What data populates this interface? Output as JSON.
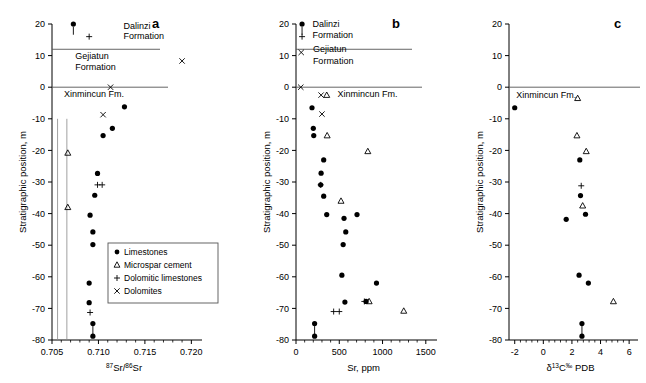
{
  "figure": {
    "panels": [
      "a",
      "b",
      "c"
    ],
    "shared_ylabel": "Stratigraphic position, m",
    "y_ticks": [
      "20",
      "10",
      "0",
      "-10",
      "-20",
      "-30",
      "-40",
      "-50",
      "-60",
      "-70",
      "-80"
    ],
    "formations": {
      "dalinzi": "Dalinzi",
      "dalinzi_second": "Formation",
      "gejiatun": "Gejiatun",
      "gejiatun_second": "Formation",
      "xinmincun": "Xinmincun Fm."
    },
    "legend": {
      "items": [
        {
          "symbol": "filled-circle",
          "label": "Limestones"
        },
        {
          "symbol": "open-triangle",
          "label": "Microspar cement"
        },
        {
          "symbol": "plus",
          "label": "Dolomitic limestones"
        },
        {
          "symbol": "cross",
          "label": "Dolomites"
        }
      ]
    }
  },
  "chart_data": [
    {
      "type": "scatter",
      "panel": "a",
      "title": "a",
      "xlabel": "87Sr/86Sr",
      "xlabel_parts": {
        "sup1": "87",
        "mid": "Sr/",
        "sup2": "86",
        "tail": "Sr"
      },
      "ylabel": "Stratigraphic position, m",
      "xlim": [
        0.705,
        0.7205
      ],
      "ylim": [
        -80,
        20
      ],
      "xticks": [
        "0.705",
        "0.710",
        "0.715",
        "0.720"
      ],
      "xtick_values": [
        0.705,
        0.71,
        0.715,
        0.72
      ],
      "yticks": [
        20,
        10,
        0,
        -10,
        -20,
        -30,
        -40,
        -50,
        -60,
        -70,
        -80
      ],
      "grid": false,
      "reference_lines_x": [
        0.7056,
        0.7066
      ],
      "series": [
        {
          "name": "Limestones",
          "symbol": "filled-circle",
          "points": [
            [
              0.7073,
              20.0
            ],
            [
              0.7128,
              -6.2
            ],
            [
              0.7115,
              -13.0
            ],
            [
              0.7105,
              -15.3
            ],
            [
              0.7099,
              -27.3
            ],
            [
              0.7096,
              -34.2
            ],
            [
              0.7091,
              -40.5
            ],
            [
              0.7094,
              -45.8
            ],
            [
              0.7094,
              -49.8
            ],
            [
              0.709,
              -62.0
            ],
            [
              0.709,
              -68.2
            ],
            [
              0.7094,
              -74.8
            ],
            [
              0.7094,
              -78.8
            ]
          ]
        },
        {
          "name": "Microspar cement",
          "symbol": "open-triangle",
          "points": [
            [
              0.7067,
              -20.8
            ],
            [
              0.7067,
              -38.0
            ]
          ]
        },
        {
          "name": "Dolomitic limestones",
          "symbol": "plus",
          "points": [
            [
              0.709,
              16.0
            ],
            [
              0.7099,
              -30.9
            ],
            [
              0.7104,
              -30.9
            ],
            [
              0.7091,
              -71.3
            ]
          ]
        },
        {
          "name": "Dolomites",
          "symbol": "cross",
          "points": [
            [
              0.719,
              8.3
            ],
            [
              0.7113,
              0.0
            ],
            [
              0.7105,
              -8.7
            ]
          ]
        }
      ],
      "annotations": [
        {
          "text": "Dalinzi",
          "x": 0.7127,
          "y": 18.5
        },
        {
          "text": "Formation",
          "x": 0.7127,
          "y": 15.2
        },
        {
          "text": "Gejiatun",
          "x": 0.7075,
          "y": 9.0
        },
        {
          "text": "Formation",
          "x": 0.7075,
          "y": 5.6
        },
        {
          "text": "Xinmincun Fm.",
          "x": 0.7063,
          "y": -3.0
        }
      ]
    },
    {
      "type": "scatter",
      "panel": "b",
      "title": "b",
      "xlabel": "Sr, ppm",
      "ylabel": "Stratigraphic position, m",
      "xlim": [
        0,
        1560
      ],
      "ylim": [
        -80,
        20
      ],
      "xticks": [
        "0",
        "500",
        "1000",
        "1500"
      ],
      "xtick_values": [
        0,
        500,
        1000,
        1500
      ],
      "yticks": [
        20,
        10,
        0,
        -10,
        -20,
        -30,
        -40,
        -50,
        -60,
        -70,
        -80
      ],
      "grid": false,
      "series": [
        {
          "name": "Limestones",
          "symbol": "filled-circle",
          "points": [
            [
              70,
              20.0
            ],
            [
              185,
              -6.5
            ],
            [
              200,
              -13.0
            ],
            [
              205,
              -15.3
            ],
            [
              320,
              -23.0
            ],
            [
              290,
              -27.2
            ],
            [
              285,
              -30.9
            ],
            [
              320,
              -34.5
            ],
            [
              355,
              -40.3
            ],
            [
              555,
              -41.5
            ],
            [
              705,
              -40.3
            ],
            [
              575,
              -45.8
            ],
            [
              545,
              -49.8
            ],
            [
              530,
              -59.5
            ],
            [
              930,
              -62.0
            ],
            [
              565,
              -68.0
            ],
            [
              810,
              -67.8
            ],
            [
              215,
              -74.8
            ],
            [
              215,
              -78.8
            ]
          ]
        },
        {
          "name": "Microspar cement",
          "symbol": "open-triangle",
          "points": [
            [
              355,
              -2.5
            ],
            [
              360,
              -15.3
            ],
            [
              830,
              -20.3
            ],
            [
              520,
              -36.0
            ],
            [
              845,
              -67.8
            ],
            [
              1245,
              -70.8
            ]
          ]
        },
        {
          "name": "Dolomitic limestones",
          "symbol": "plus",
          "points": [
            [
              70,
              16.0
            ],
            [
              285,
              -30.9
            ],
            [
              790,
              -67.8
            ],
            [
              435,
              -71.0
            ],
            [
              500,
              -71.0
            ]
          ]
        },
        {
          "name": "Dolomites",
          "symbol": "cross",
          "points": [
            [
              60,
              11.0
            ],
            [
              55,
              0.0
            ],
            [
              290,
              -2.5
            ],
            [
              300,
              -8.5
            ]
          ]
        }
      ],
      "annotations": [
        {
          "text": "Dalinzi",
          "x": 190,
          "y": 19.0
        },
        {
          "text": "Formation",
          "x": 190,
          "y": 15.5
        },
        {
          "text": "Gejiatun",
          "x": 195,
          "y": 11.0
        },
        {
          "text": "Formation",
          "x": 195,
          "y": 7.4
        },
        {
          "text": "Xinmincun Fm.",
          "x": 480,
          "y": -3.2
        }
      ]
    },
    {
      "type": "scatter",
      "panel": "c",
      "title": "c",
      "xlabel": "d13C permil PDB",
      "xlabel_parts": {
        "delta": "δ",
        "sup": "13",
        "elem": "C",
        "permil": "‰",
        "tail": " PDB"
      },
      "ylabel": "Stratigraphic position, m",
      "xlim": [
        -2.4,
        6.2
      ],
      "ylim": [
        -80,
        20
      ],
      "xticks": [
        "-2",
        "0",
        "2",
        "4",
        "6"
      ],
      "xtick_values": [
        -2,
        0,
        2,
        4,
        6
      ],
      "yticks": [
        20,
        10,
        0,
        -10,
        -20,
        -30,
        -40,
        -50,
        -60,
        -70,
        -80
      ],
      "grid": false,
      "series": [
        {
          "name": "Limestones",
          "symbol": "filled-circle",
          "points": [
            [
              -2.0,
              -6.5
            ],
            [
              2.55,
              -23.0
            ],
            [
              2.6,
              -34.3
            ],
            [
              2.95,
              -40.2
            ],
            [
              1.6,
              -41.8
            ],
            [
              2.5,
              -59.5
            ],
            [
              3.15,
              -62.0
            ],
            [
              2.7,
              -74.8
            ],
            [
              2.7,
              -78.8
            ]
          ]
        },
        {
          "name": "Microspar cement",
          "symbol": "open-triangle",
          "points": [
            [
              2.4,
              -3.5
            ],
            [
              2.35,
              -15.3
            ],
            [
              3.0,
              -20.3
            ],
            [
              2.75,
              -37.5
            ],
            [
              4.9,
              -67.8
            ]
          ]
        },
        {
          "name": "Dolomitic limestones",
          "symbol": "plus",
          "points": [
            [
              2.65,
              -31.2
            ]
          ]
        },
        {
          "name": "Dolomites",
          "symbol": "cross",
          "points": []
        }
      ],
      "annotations": [
        {
          "text": "Xinmincun Fm.",
          "x": -1.9,
          "y": -3.4
        }
      ]
    }
  ]
}
